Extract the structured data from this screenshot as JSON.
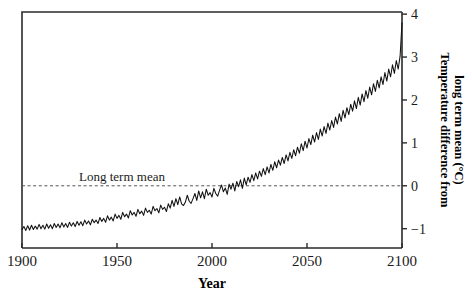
{
  "chart_data": {
    "type": "line",
    "title": "",
    "xlabel": "Year",
    "ylabel": "Temperature difference from long term mean (°C)",
    "ylabel_line1": "Temperature difference from",
    "ylabel_line2": "long term mean (°C)",
    "xlim": [
      1900,
      2100
    ],
    "ylim": [
      -1.45,
      4.05
    ],
    "xticks": [
      1900,
      1950,
      2000,
      2050,
      2100
    ],
    "xtick_labels": [
      "1900",
      "1950",
      "2000",
      "2050",
      "2100"
    ],
    "yticks": [
      -1,
      0,
      1,
      2,
      3,
      4
    ],
    "ytick_labels": [
      "−1",
      "0",
      "1",
      "2",
      "3",
      "4"
    ],
    "y_axis_position": "right",
    "grid": false,
    "legend": null,
    "annotations": [
      {
        "text": "Long term mean",
        "x": 1930,
        "y": 0.12,
        "kind": "reference-line-label"
      }
    ],
    "reference_lines": [
      {
        "name": "long-term-mean",
        "orientation": "horizontal",
        "value": 0,
        "style": "dashed",
        "color": "#555555"
      }
    ],
    "colors": {
      "series": "#111111",
      "frame": "#2b2b2b",
      "reference": "#555555",
      "background": "#ffffff"
    },
    "series": [
      {
        "name": "Temperature anomaly",
        "x": [
          1900,
          1901,
          1902,
          1903,
          1904,
          1905,
          1906,
          1907,
          1908,
          1909,
          1910,
          1911,
          1912,
          1913,
          1914,
          1915,
          1916,
          1917,
          1918,
          1919,
          1920,
          1921,
          1922,
          1923,
          1924,
          1925,
          1926,
          1927,
          1928,
          1929,
          1930,
          1931,
          1932,
          1933,
          1934,
          1935,
          1936,
          1937,
          1938,
          1939,
          1940,
          1941,
          1942,
          1943,
          1944,
          1945,
          1946,
          1947,
          1948,
          1949,
          1950,
          1951,
          1952,
          1953,
          1954,
          1955,
          1956,
          1957,
          1958,
          1959,
          1960,
          1961,
          1962,
          1963,
          1964,
          1965,
          1966,
          1967,
          1968,
          1969,
          1970,
          1971,
          1972,
          1973,
          1974,
          1975,
          1976,
          1977,
          1978,
          1979,
          1980,
          1981,
          1982,
          1983,
          1984,
          1985,
          1986,
          1987,
          1988,
          1989,
          1990,
          1991,
          1992,
          1993,
          1994,
          1995,
          1996,
          1997,
          1998,
          1999,
          2000,
          2001,
          2002,
          2003,
          2004,
          2005,
          2006,
          2007,
          2008,
          2009,
          2010,
          2011,
          2012,
          2013,
          2014,
          2015,
          2016,
          2017,
          2018,
          2019,
          2020,
          2021,
          2022,
          2023,
          2024,
          2025,
          2026,
          2027,
          2028,
          2029,
          2030,
          2031,
          2032,
          2033,
          2034,
          2035,
          2036,
          2037,
          2038,
          2039,
          2040,
          2041,
          2042,
          2043,
          2044,
          2045,
          2046,
          2047,
          2048,
          2049,
          2050,
          2051,
          2052,
          2053,
          2054,
          2055,
          2056,
          2057,
          2058,
          2059,
          2060,
          2061,
          2062,
          2063,
          2064,
          2065,
          2066,
          2067,
          2068,
          2069,
          2070,
          2071,
          2072,
          2073,
          2074,
          2075,
          2076,
          2077,
          2078,
          2079,
          2080,
          2081,
          2082,
          2083,
          2084,
          2085,
          2086,
          2087,
          2088,
          2089,
          2090,
          2091,
          2092,
          2093,
          2094,
          2095,
          2096,
          2097,
          2098,
          2099,
          2100
        ],
        "values": [
          -1.02,
          -0.95,
          -1.04,
          -0.93,
          -1.03,
          -0.92,
          -1.02,
          -0.94,
          -1.01,
          -0.9,
          -1.0,
          -0.92,
          -1.01,
          -0.89,
          -0.99,
          -0.91,
          -1.0,
          -0.88,
          -0.97,
          -0.89,
          -0.98,
          -0.86,
          -0.96,
          -0.88,
          -0.97,
          -0.85,
          -0.94,
          -0.86,
          -0.95,
          -0.83,
          -0.92,
          -0.84,
          -0.93,
          -0.8,
          -0.89,
          -0.82,
          -0.91,
          -0.78,
          -0.86,
          -0.8,
          -0.88,
          -0.74,
          -0.83,
          -0.76,
          -0.85,
          -0.7,
          -0.8,
          -0.73,
          -0.82,
          -0.66,
          -0.76,
          -0.69,
          -0.78,
          -0.62,
          -0.72,
          -0.66,
          -0.75,
          -0.58,
          -0.68,
          -0.62,
          -0.71,
          -0.55,
          -0.65,
          -0.59,
          -0.69,
          -0.52,
          -0.62,
          -0.57,
          -0.66,
          -0.48,
          -0.58,
          -0.53,
          -0.63,
          -0.45,
          -0.55,
          -0.5,
          -0.6,
          -0.42,
          -0.52,
          -0.34,
          -0.48,
          -0.3,
          -0.44,
          -0.26,
          -0.42,
          -0.46,
          -0.38,
          -0.22,
          -0.36,
          -0.41,
          -0.3,
          -0.18,
          -0.34,
          -0.12,
          -0.28,
          -0.14,
          -0.3,
          -0.08,
          -0.22,
          -0.16,
          -0.26,
          -0.06,
          -0.18,
          -0.24,
          -0.1,
          0.02,
          -0.14,
          -0.05,
          -0.2,
          0.04,
          -0.08,
          0.06,
          -0.12,
          0.1,
          -0.02,
          0.14,
          -0.06,
          0.18,
          0.02,
          0.2,
          0.08,
          0.26,
          0.12,
          0.3,
          0.16,
          0.34,
          0.22,
          0.4,
          0.26,
          0.44,
          0.3,
          0.5,
          0.36,
          0.56,
          0.42,
          0.6,
          0.48,
          0.66,
          0.52,
          0.72,
          0.58,
          0.78,
          0.64,
          0.84,
          0.7,
          0.9,
          0.76,
          0.98,
          0.82,
          1.04,
          0.88,
          1.1,
          0.96,
          1.18,
          1.02,
          1.24,
          1.08,
          1.32,
          1.16,
          1.38,
          1.22,
          1.46,
          1.3,
          1.52,
          1.36,
          1.6,
          1.44,
          1.68,
          1.5,
          1.76,
          1.58,
          1.82,
          1.66,
          1.9,
          1.74,
          1.98,
          1.8,
          2.06,
          1.88,
          2.14,
          1.96,
          2.22,
          2.04,
          2.3,
          2.12,
          2.38,
          2.2,
          2.46,
          2.28,
          2.54,
          2.36,
          2.64,
          2.44,
          2.72,
          2.54,
          2.82,
          2.62,
          2.92,
          2.72,
          3.02,
          3.8
        ]
      }
    ]
  }
}
